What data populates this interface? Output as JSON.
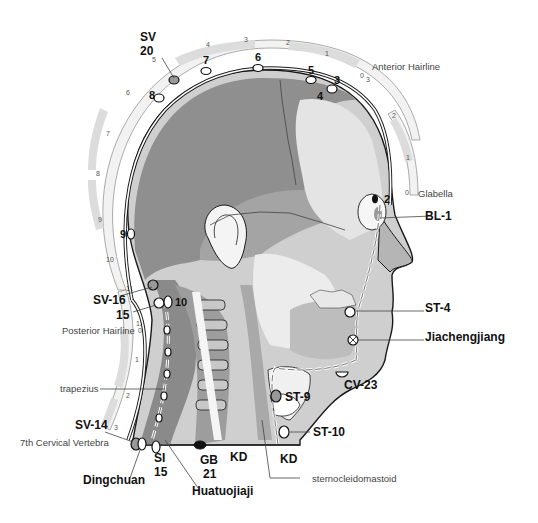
{
  "figure": {
    "ruler_arc_labels": {
      "top_front": [
        "0",
        "1",
        "2",
        "3",
        "4",
        "5"
      ],
      "rear": [
        "5",
        "6",
        "7",
        "8",
        "9",
        "10",
        "11",
        "12"
      ],
      "neck": [
        "0",
        "1",
        "2",
        "3"
      ],
      "forehead": [
        "3",
        "2",
        "1",
        "0"
      ]
    },
    "landmarks": {
      "anterior_hairline": "Anterior Hairline",
      "glabella": "Glabella",
      "posterior_hairline": "Posterior Hairline",
      "seventh_cervical": "7th Cervical Vertebra",
      "trapezius": "trapezius",
      "sternocleidomastoid": "sternocleidomastoid"
    },
    "points": {
      "sv": "SV",
      "sv20_num": "20",
      "n2": "2",
      "n3": "3",
      "n4": "4",
      "n5": "5",
      "n6": "6",
      "n7": "7",
      "n8": "8",
      "n9": "9",
      "n10": "10",
      "sv16": "SV-16",
      "n15": "15",
      "sv14": "SV-14",
      "bl1": "BL-1",
      "st4": "ST-4",
      "jiachengjiang": "Jiachengjiang",
      "cv23": "CV-23",
      "st9": "ST-9",
      "st10": "ST-10",
      "si": "SI",
      "si15_num": "15",
      "gb": "GB",
      "gb21_num": "21",
      "kd_left": "KD",
      "kd_right": "KD",
      "dingchuan": "Dingchuan",
      "huatuojiaji": "Huatuojiaji"
    },
    "colors": {
      "skull_dark": "#8f8f8f",
      "skull_mid": "#b5b5b5",
      "face_light": "#d9d9d9",
      "ruler_fill": "#e0e0e0",
      "outline": "#1a1a1a"
    }
  }
}
